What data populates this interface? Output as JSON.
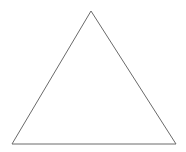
{
  "figure": {
    "name": "triangle-line-drawing",
    "canvas": {
      "width": 186,
      "height": 152,
      "background_color": "#ffffff"
    },
    "shape": {
      "type": "triangle",
      "subtype": "isosceles",
      "fill_color": "#ffffff",
      "stroke_color": "#6a6a6a",
      "stroke_width": 1,
      "vertices": [
        {
          "label": "apex",
          "x": 91,
          "y": 11
        },
        {
          "label": "bottom-right",
          "x": 176,
          "y": 144
        },
        {
          "label": "bottom-left",
          "x": 12,
          "y": 144
        }
      ],
      "points_attr": "91,11 176,144 12,144",
      "base_width": 164,
      "height": 133
    }
  }
}
